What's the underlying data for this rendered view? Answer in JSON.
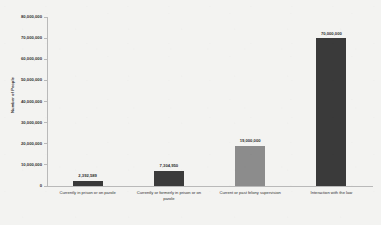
{
  "chart_data": {
    "type": "bar",
    "title": "",
    "xlabel": "",
    "ylabel": "Number of People",
    "ylim": [
      0,
      80000000
    ],
    "ytick_values": [
      80000000,
      70000000,
      60000000,
      50000000,
      40000000,
      30000000,
      20000000,
      10000000,
      0
    ],
    "ytick_labels": [
      "80,000,000",
      "70,000,000",
      "60,000,000",
      "50,000,000",
      "40,000,000",
      "30,000,000",
      "20,000,000",
      "10,000,000",
      "0"
    ],
    "grid": false,
    "legend": "none",
    "categories": [
      "Currently in prison or on parole",
      "Currently or formerly in prison or on parole",
      "Current or past felony supervision",
      "Interaction with the law"
    ],
    "values": [
      2392589,
      7304950,
      19000000,
      70000000
    ],
    "data_labels": [
      "2,392,589",
      "7,304,950",
      "19,000,000",
      "70,000,000"
    ],
    "bar_colors": [
      "#393939",
      "#3b3b3b",
      "#8c8c8c",
      "#3a3a3a"
    ],
    "background_color": "#f3f3f1",
    "axis_color": "#b9b9b9"
  }
}
